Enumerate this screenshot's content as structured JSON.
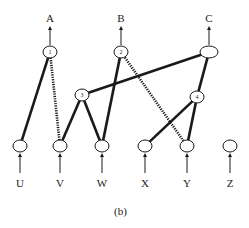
{
  "diagram": {
    "caption": "(b)",
    "outputs": [
      {
        "id": "A",
        "label": "A",
        "x": 50,
        "y": 52,
        "node_label": "1"
      },
      {
        "id": "B",
        "label": "B",
        "x": 121,
        "y": 52,
        "node_label": "2"
      },
      {
        "id": "C",
        "label": "C",
        "x": 209,
        "y": 52,
        "node_label": ""
      }
    ],
    "hidden": [
      {
        "id": "n3",
        "node_label": "3",
        "x": 82,
        "y": 95
      },
      {
        "id": "n4",
        "node_label": "4",
        "x": 197,
        "y": 97
      }
    ],
    "inputs": [
      {
        "id": "U",
        "label": "U",
        "x": 20,
        "y": 146
      },
      {
        "id": "V",
        "label": "V",
        "x": 60,
        "y": 146
      },
      {
        "id": "W",
        "label": "W",
        "x": 102,
        "y": 146
      },
      {
        "id": "X",
        "label": "X",
        "x": 145,
        "y": 146
      },
      {
        "id": "Y",
        "label": "Y",
        "x": 187,
        "y": 146
      },
      {
        "id": "Z",
        "label": "Z",
        "x": 230,
        "y": 146
      }
    ],
    "edges_solid": [
      [
        "U",
        "A"
      ],
      [
        "V",
        "n3"
      ],
      [
        "W",
        "n3"
      ],
      [
        "W",
        "B"
      ],
      [
        "n3",
        "C"
      ],
      [
        "X",
        "n4"
      ],
      [
        "Y",
        "n4"
      ],
      [
        "n4",
        "C"
      ]
    ],
    "edges_dotted": [
      [
        "V",
        "A"
      ],
      [
        "Y",
        "B"
      ]
    ],
    "colors": {
      "line": "#1a1a1a",
      "background": "#ffffff"
    }
  }
}
